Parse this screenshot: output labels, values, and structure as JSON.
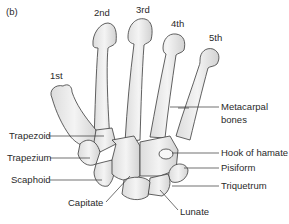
{
  "panel_label": "(b)",
  "digits": {
    "first": "1st",
    "second": "2nd",
    "third": "3rd",
    "fourth": "4th",
    "fifth": "5th"
  },
  "labels": {
    "metacarpal_line1": "Metacarpal",
    "metacarpal_line2": "bones",
    "trapezoid": "Trapezoid",
    "trapezium": "Trapezium",
    "scaphoid": "Scaphoid",
    "capitate": "Capitate",
    "hook_of_hamate": "Hook of hamate",
    "pisiform": "Pisiform",
    "triquetrum": "Triquetrum",
    "lunate": "Lunate"
  },
  "colors": {
    "bone_fill": "#ececec",
    "bone_shade": "#d6d6d6",
    "outline": "#3a3a3a",
    "leader": "#333333"
  }
}
